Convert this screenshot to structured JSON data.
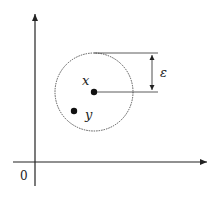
{
  "diagram": {
    "title": "",
    "origin_label": "0",
    "center_label": "x",
    "point_label": "y",
    "radius_label": "ε",
    "colors": {
      "line": "#333333",
      "dashed_circle": "#555555",
      "point": "#111111"
    }
  }
}
